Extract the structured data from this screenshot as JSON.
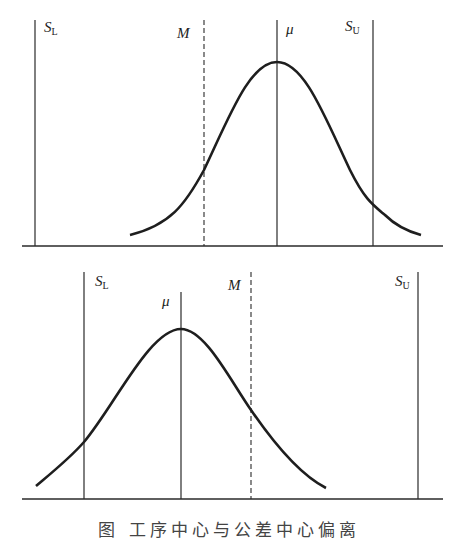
{
  "figure": {
    "caption": "图  工序中心与公差中心偏离",
    "panels": [
      {
        "id": "top",
        "labels": {
          "lower_spec": "S",
          "lower_spec_sub": "L",
          "target": "M",
          "mean": "μ",
          "upper_spec": "S",
          "upper_spec_sub": "U"
        },
        "description": "Process mean μ shifted right of tolerance center M, toward upper limit S_U"
      },
      {
        "id": "bottom",
        "labels": {
          "lower_spec": "S",
          "lower_spec_sub": "L",
          "target": "M",
          "mean": "μ",
          "upper_spec": "S",
          "upper_spec_sub": "U"
        },
        "description": "Process mean μ shifted left of tolerance center M, toward lower limit S_L"
      }
    ]
  },
  "colors": {
    "line": "#2a2a2a",
    "curve": "#1e1e1e",
    "background": "#ffffff"
  }
}
